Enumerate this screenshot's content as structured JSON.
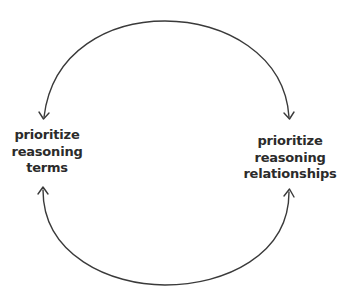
{
  "diagram": {
    "type": "cycle",
    "nodes": [
      {
        "id": "terms",
        "lines": [
          "prioritize",
          "reasoning",
          "terms"
        ]
      },
      {
        "id": "relationships",
        "lines": [
          "prioritize",
          "reasoning",
          "relationships"
        ]
      }
    ],
    "edges": [
      {
        "from": "top-arc",
        "direction": "both",
        "arrow_targets": [
          "terms",
          "relationships"
        ]
      },
      {
        "from": "bottom-arc",
        "direction": "both",
        "arrow_targets": [
          "terms",
          "relationships"
        ]
      }
    ],
    "colors": {
      "stroke": "#3a3a3a",
      "text": "#2b2b2b",
      "background": "#ffffff"
    }
  }
}
